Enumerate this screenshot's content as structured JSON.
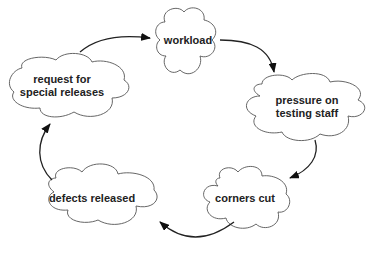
{
  "diagram": {
    "type": "cycle",
    "nodes": [
      {
        "id": "workload",
        "label": "workload"
      },
      {
        "id": "pressure",
        "label_line1": "pressure on",
        "label_line2": "testing staff"
      },
      {
        "id": "corners",
        "label": "corners cut"
      },
      {
        "id": "defects",
        "label": "defects released"
      },
      {
        "id": "request",
        "label_line1": "request for",
        "label_line2": "special releases"
      }
    ],
    "edges": [
      {
        "from": "workload",
        "to": "pressure"
      },
      {
        "from": "pressure",
        "to": "corners"
      },
      {
        "from": "corners",
        "to": "defects"
      },
      {
        "from": "defects",
        "to": "request"
      },
      {
        "from": "request",
        "to": "workload"
      }
    ],
    "colors": {
      "outline": "#555555",
      "arrow": "#222222",
      "text": "#222222",
      "background": "#ffffff"
    }
  }
}
